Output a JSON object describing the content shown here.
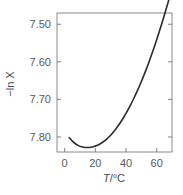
{
  "chart_data": {
    "type": "line",
    "title": "",
    "subtitle": "",
    "xlabel": "T/°C",
    "ylabel": "−ln X",
    "xlabel_parts": {
      "symbol": "T",
      "rest": "/°C"
    },
    "xlim": [
      -5,
      70
    ],
    "ylim": [
      7.84,
      7.47
    ],
    "y_inverted": true,
    "grid": false,
    "legend": null,
    "xticks": [
      0,
      20,
      40,
      60
    ],
    "xtick_labels": [
      "0",
      "20",
      "40",
      "60"
    ],
    "yticks": [
      7.5,
      7.6,
      7.7,
      7.8
    ],
    "ytick_labels": [
      "7.50",
      "7.60",
      "7.70",
      "7.80"
    ],
    "line_color": "#2b2b2b",
    "line_width": 1.6,
    "frame_color": "#808080",
    "background": "#ffffff",
    "series": [
      {
        "name": "solubility",
        "x": [
          3,
          5,
          7,
          9,
          11,
          13,
          15,
          17,
          19,
          21,
          23,
          25,
          27,
          29,
          31,
          33,
          35,
          37,
          39,
          41,
          43,
          45,
          47,
          49,
          51,
          53,
          55,
          57,
          59,
          61,
          63,
          65,
          67,
          68
        ],
        "y": [
          7.802,
          7.811,
          7.818,
          7.823,
          7.8262,
          7.8278,
          7.8282,
          7.8275,
          7.8256,
          7.8226,
          7.8186,
          7.8134,
          7.807,
          7.7994,
          7.7906,
          7.7806,
          7.7696,
          7.7574,
          7.7442,
          7.73,
          7.7146,
          7.6982,
          7.6808,
          7.6622,
          7.6426,
          7.622,
          7.6002,
          7.5774,
          7.5536,
          7.5286,
          7.5028,
          7.4758,
          7.448,
          7.434
        ]
      }
    ],
    "annotations": []
  },
  "figure": {
    "alt": "Plot of minus natural log of mole fraction solubility versus temperature in degrees Celsius"
  }
}
